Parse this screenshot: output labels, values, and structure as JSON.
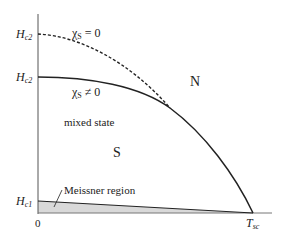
{
  "diagram": {
    "title": "",
    "axes": {
      "y_labels": {
        "hc2_upper": {
          "main": "H",
          "sub": "c2"
        },
        "hc2_lower": {
          "main": "H",
          "sub": "c2"
        },
        "hc1": {
          "main": "H",
          "sub": "c1"
        }
      },
      "x_labels": {
        "origin": "0",
        "tsc": {
          "main": "T",
          "sub": "sc"
        }
      }
    },
    "curves": {
      "dashed": {
        "label_chi": "χ",
        "label_sub": "S",
        "label_rel": " = 0"
      },
      "solid": {
        "label_chi": "χ",
        "label_sub": "S",
        "label_rel": " ≠ 0"
      }
    },
    "regions": {
      "normal": "N",
      "superconducting": "S",
      "mixed": "mixed state",
      "meissner": "Meissner region"
    },
    "colors": {
      "line": "#222222",
      "meissner_fill": "#d9d9d9",
      "axis": "#555555"
    }
  }
}
